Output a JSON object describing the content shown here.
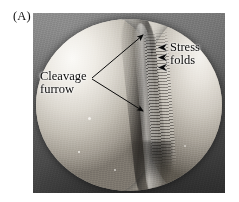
{
  "figure": {
    "panel_letter": "(A)",
    "type": "scanning-electron-micrograph"
  },
  "annotations": [
    {
      "id": "cleavage-furrow",
      "line1": "Cleavage",
      "line2": "furrow",
      "pointer": "double-arrow-v",
      "vertex": {
        "x": 91,
        "y": 78
      },
      "tips": [
        {
          "x": 146,
          "y": 32
        },
        {
          "x": 146,
          "y": 114
        }
      ]
    },
    {
      "id": "stress-folds",
      "line1": "Stress",
      "line2": "folds",
      "pointer": "three-arrowheads-left",
      "arrowheads": [
        {
          "x": 167,
          "y": 47
        },
        {
          "x": 167,
          "y": 57
        },
        {
          "x": 167,
          "y": 67
        }
      ]
    }
  ],
  "colors": {
    "background": "#ffffff",
    "plate_dark": "#2e2e2e",
    "cell_highlight": "#f2f0ec",
    "cell_shadow": "#4a453f",
    "ink": "#0c0c0c"
  },
  "plate": {
    "left": 33,
    "top": 13,
    "width": 192,
    "height": 180
  }
}
